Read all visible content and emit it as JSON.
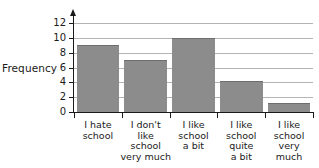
{
  "chart_data": {
    "type": "bar",
    "title": "",
    "xlabel": "",
    "ylabel": "Frequency",
    "categories": [
      "I hate\nschool",
      "I don't\nlike\nschool\nvery much",
      "I like\nschool\na bit",
      "I like\nschool\nquite\na bit",
      "I like\nschool\nvery\nmuch"
    ],
    "values": [
      9,
      7,
      10,
      4.2,
      1.2
    ],
    "ylim": [
      0,
      13
    ],
    "yticks": [
      0,
      2,
      4,
      6,
      8,
      10,
      12
    ],
    "ytick_labels": [
      "0",
      "2",
      "4",
      "6",
      "8",
      "10",
      "12"
    ],
    "grid": "horizontal",
    "legend": "none",
    "bar_color": "#8c8c8c",
    "axis_color": "#1a1a1a",
    "gridline_color": "#b4b4b4",
    "background_color": "#ffffff"
  }
}
